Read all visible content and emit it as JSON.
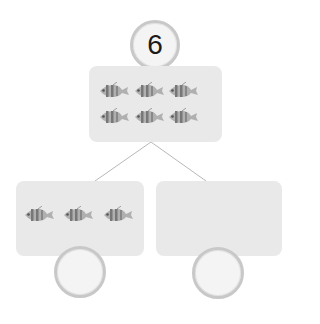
{
  "diagram": {
    "type": "number-bond",
    "whole": {
      "value": "6",
      "fish_count": 6
    },
    "parts": [
      {
        "fish_count": 3,
        "value": ""
      },
      {
        "fish_count": 0,
        "value": ""
      }
    ],
    "icons": {
      "item": "fish-icon"
    },
    "colors": {
      "box": "#e9e9e9",
      "circle_border": "#c8c8c8",
      "line": "#b5b5b5",
      "fish": "#8a8a8a"
    }
  }
}
